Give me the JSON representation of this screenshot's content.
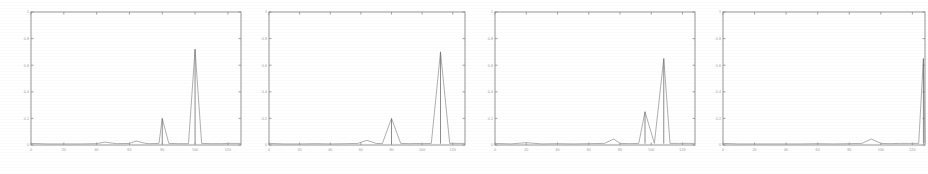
{
  "figure": {
    "name": "four-panel-impulse-spectra",
    "background_color": "#ffffff",
    "line_color": "#6e6e6e",
    "axis_color": "#8a8a8a",
    "label_color": "#9c9c9c",
    "panel_count": 4
  },
  "chart_data": [
    {
      "type": "line",
      "title": "",
      "subtitle": "",
      "xlabel": "",
      "ylabel": "",
      "xlim": [
        0,
        128
      ],
      "ylim": [
        0,
        1
      ],
      "grid": false,
      "legend": "none",
      "xticks": [
        0,
        20,
        40,
        60,
        80,
        100,
        120
      ],
      "xticklabels": [
        "0",
        "20",
        "40",
        "60",
        "80",
        "100",
        "120"
      ],
      "yticks": [
        0,
        0.2,
        0.4,
        0.6,
        0.8,
        1
      ],
      "yticklabels": [
        "0",
        "0.2",
        "0.4",
        "0.6",
        "0.8",
        "1"
      ],
      "x": [
        0,
        10,
        20,
        30,
        40,
        45,
        52,
        60,
        64,
        70,
        72,
        78,
        80,
        84,
        90,
        96,
        100,
        104,
        110,
        116,
        120,
        128
      ],
      "values": [
        0.012,
        0.008,
        0.008,
        0.008,
        0.01,
        0.022,
        0.01,
        0.012,
        0.03,
        0.012,
        0.01,
        0.012,
        0.2,
        0.012,
        0.01,
        0.01,
        0.72,
        0.012,
        0.01,
        0.01,
        0.012,
        0.012
      ],
      "peaks": [
        {
          "x": 80,
          "y": 0.2
        },
        {
          "x": 100,
          "y": 0.72
        }
      ]
    },
    {
      "type": "line",
      "title": "",
      "subtitle": "",
      "xlabel": "",
      "ylabel": "",
      "xlim": [
        0,
        128
      ],
      "ylim": [
        0,
        1
      ],
      "grid": false,
      "legend": "none",
      "xticks": [
        0,
        20,
        40,
        60,
        80,
        100,
        120
      ],
      "xticklabels": [
        "0",
        "20",
        "40",
        "60",
        "80",
        "100",
        "120"
      ],
      "yticks": [
        0,
        0.2,
        0.4,
        0.6,
        0.8,
        1
      ],
      "yticklabels": [
        "0",
        "0.2",
        "0.4",
        "0.6",
        "0.8",
        "1"
      ],
      "x": [
        0,
        10,
        20,
        30,
        40,
        50,
        58,
        64,
        70,
        74,
        80,
        86,
        92,
        96,
        100,
        106,
        112,
        118,
        124,
        128
      ],
      "values": [
        0.012,
        0.008,
        0.008,
        0.01,
        0.008,
        0.01,
        0.012,
        0.035,
        0.012,
        0.01,
        0.2,
        0.012,
        0.01,
        0.012,
        0.01,
        0.012,
        0.7,
        0.012,
        0.012,
        0.012
      ],
      "peaks": [
        {
          "x": 80,
          "y": 0.2
        },
        {
          "x": 112,
          "y": 0.7
        }
      ]
    },
    {
      "type": "line",
      "title": "",
      "subtitle": "",
      "xlabel": "",
      "ylabel": "",
      "xlim": [
        0,
        128
      ],
      "ylim": [
        0,
        1
      ],
      "grid": false,
      "legend": "none",
      "xticks": [
        0,
        20,
        40,
        60,
        80,
        100,
        120
      ],
      "xticklabels": [
        "0",
        "20",
        "40",
        "60",
        "80",
        "100",
        "120"
      ],
      "yticks": [
        0,
        0.2,
        0.4,
        0.6,
        0.8,
        1
      ],
      "yticklabels": [
        "0",
        "0.2",
        "0.4",
        "0.6",
        "0.8",
        "1"
      ],
      "x": [
        0,
        10,
        20,
        30,
        40,
        50,
        60,
        70,
        76,
        80,
        86,
        92,
        96,
        102,
        108,
        112,
        118,
        124,
        128
      ],
      "values": [
        0.012,
        0.008,
        0.018,
        0.008,
        0.01,
        0.008,
        0.01,
        0.012,
        0.045,
        0.012,
        0.01,
        0.012,
        0.25,
        0.012,
        0.65,
        0.012,
        0.012,
        0.012,
        0.012
      ],
      "peaks": [
        {
          "x": 96,
          "y": 0.25
        },
        {
          "x": 108,
          "y": 0.65
        }
      ]
    },
    {
      "type": "line",
      "title": "",
      "subtitle": "",
      "xlabel": "",
      "ylabel": "",
      "xlim": [
        0,
        128
      ],
      "ylim": [
        0,
        1
      ],
      "grid": false,
      "legend": "none",
      "xticks": [
        0,
        20,
        40,
        60,
        80,
        100,
        120
      ],
      "xticklabels": [
        "0",
        "20",
        "40",
        "60",
        "80",
        "100",
        "120"
      ],
      "yticks": [
        0,
        0.2,
        0.4,
        0.6,
        0.8,
        1
      ],
      "yticklabels": [
        "0",
        "0.2",
        "0.4",
        "0.6",
        "0.8",
        "1"
      ],
      "x": [
        0,
        10,
        20,
        30,
        40,
        50,
        60,
        70,
        80,
        88,
        94,
        100,
        106,
        112,
        118,
        124,
        127,
        128
      ],
      "values": [
        0.012,
        0.008,
        0.008,
        0.008,
        0.008,
        0.008,
        0.01,
        0.008,
        0.01,
        0.012,
        0.045,
        0.012,
        0.01,
        0.012,
        0.012,
        0.012,
        0.65,
        0.012
      ],
      "peaks": [
        {
          "x": 127,
          "y": 0.65
        }
      ]
    }
  ],
  "panels": [
    {
      "name": "panel-1",
      "left_px": 8,
      "width_px": 236
    },
    {
      "name": "panel-2",
      "left_px": 246,
      "width_px": 222
    },
    {
      "name": "panel-3",
      "left_px": 472,
      "width_px": 226
    },
    {
      "name": "panel-4",
      "left_px": 700,
      "width_px": 228
    }
  ]
}
